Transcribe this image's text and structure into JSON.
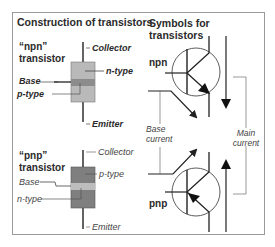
{
  "left_panel": {
    "title": "Construction of transistors",
    "npn": {
      "name_line1": "“npn”",
      "name_line2": "transistor",
      "collector": "Collector",
      "n_type": "n-type",
      "base": "Base",
      "p_type": "p-type",
      "emitter": "Emitter"
    },
    "pnp": {
      "name_line1": "“pnp”",
      "name_line2": "transistor",
      "collector": "Collector",
      "p_type": "p-type",
      "base": "Base",
      "n_type": "n-type",
      "emitter": "Emitter"
    }
  },
  "right_panel": {
    "title_line1": "Symbols for",
    "title_line2": "transistors",
    "npn_label": "npn",
    "pnp_label": "pnp",
    "base_current_line1": "Base",
    "base_current_line2": "current",
    "main_current_line1": "Main",
    "main_current_line2": "current"
  },
  "colors": {
    "frame": "#9a9a9a",
    "npn_outer": "#b9b9b9",
    "npn_base_band": "#8c8c8c",
    "pnp_outer": "#7f7f7f",
    "pnp_base_band": "#bdbdbd",
    "lines": "#222222"
  }
}
